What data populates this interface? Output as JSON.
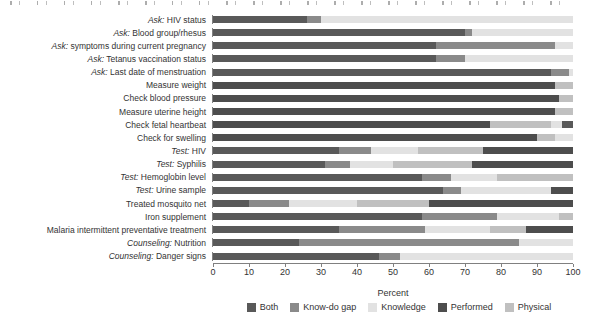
{
  "figure": {
    "xlabel": "Percent",
    "x_ticks": [
      "0",
      "10",
      "20",
      "30",
      "40",
      "50",
      "60",
      "70",
      "80",
      "90",
      "100"
    ]
  },
  "legend": {
    "position": "bottom",
    "items": [
      {
        "label": "Both",
        "color": "#595959"
      },
      {
        "label": "Know-do gap",
        "color": "#8a8a8a"
      },
      {
        "label": "Knowledge",
        "color": "#e2e2e2"
      },
      {
        "label": "Performed",
        "color": "#4d4d4d"
      },
      {
        "label": "Physical",
        "color": "#c0c0c0"
      }
    ]
  },
  "chart_data": {
    "type": "bar",
    "orientation": "horizontal",
    "stacked": true,
    "xlabel": "Percent",
    "xlim": [
      0,
      100
    ],
    "x_tick_values": [
      0,
      10,
      20,
      30,
      40,
      50,
      60,
      70,
      80,
      90,
      100
    ],
    "grid": false,
    "legend_position": "bottom",
    "palette": {
      "Both": "#595959",
      "Know-do gap": "#8a8a8a",
      "Knowledge": "#e2e2e2",
      "Performed": "#4d4d4d",
      "Physical": "#c0c0c0"
    },
    "categories": [
      "Ask: HIV status",
      "Ask: Blood group/rhesus",
      "Ask: symptoms during current pregnancy",
      "Ask: Tetanus vaccination status",
      "Ask: Last date of menstruation",
      "Measure weight",
      "Check blood pressure",
      "Measure uterine height",
      "Check fetal heartbeat",
      "Check for swelling",
      "Test: HIV",
      "Test: Syphilis",
      "Test: Hemoglobin level",
      "Test: Urine sample",
      "Treated mosquito net",
      "Iron supplement",
      "Malaria intermittent preventative treatment",
      "Counseling: Nutrition",
      "Counseling: Danger signs"
    ],
    "rows": [
      {
        "prefix": "Ask:",
        "label": " HIV status",
        "segments": [
          {
            "name": "Both",
            "value": 26
          },
          {
            "name": "Know-do gap",
            "value": 4
          },
          {
            "name": "Knowledge",
            "value": 70
          }
        ]
      },
      {
        "prefix": "Ask:",
        "label": " Blood group/rhesus",
        "segments": [
          {
            "name": "Both",
            "value": 70
          },
          {
            "name": "Know-do gap",
            "value": 2
          },
          {
            "name": "Knowledge",
            "value": 28
          }
        ]
      },
      {
        "prefix": "Ask:",
        "label": " symptoms during current pregnancy",
        "segments": [
          {
            "name": "Both",
            "value": 62
          },
          {
            "name": "Know-do gap",
            "value": 33
          },
          {
            "name": "Knowledge",
            "value": 5
          }
        ]
      },
      {
        "prefix": "Ask:",
        "label": " Tetanus vaccination status",
        "segments": [
          {
            "name": "Both",
            "value": 62
          },
          {
            "name": "Know-do gap",
            "value": 8
          },
          {
            "name": "Knowledge",
            "value": 30
          }
        ]
      },
      {
        "prefix": "Ask:",
        "label": " Last date of menstruation",
        "segments": [
          {
            "name": "Both",
            "value": 94
          },
          {
            "name": "Know-do gap",
            "value": 5
          },
          {
            "name": "Knowledge",
            "value": 1
          }
        ]
      },
      {
        "prefix": "",
        "label": "Measure weight",
        "segments": [
          {
            "name": "Performed",
            "value": 95
          },
          {
            "name": "Physical",
            "value": 5
          }
        ]
      },
      {
        "prefix": "",
        "label": "Check blood pressure",
        "segments": [
          {
            "name": "Performed",
            "value": 96
          },
          {
            "name": "Physical",
            "value": 4
          }
        ]
      },
      {
        "prefix": "",
        "label": "Measure uterine height",
        "segments": [
          {
            "name": "Performed",
            "value": 95
          },
          {
            "name": "Physical",
            "value": 5
          }
        ]
      },
      {
        "prefix": "",
        "label": "Check fetal heartbeat",
        "segments": [
          {
            "name": "Performed",
            "value": 77
          },
          {
            "name": "Physical",
            "value": 17
          },
          {
            "name": "Knowledge",
            "value": 3
          },
          {
            "name": "Both",
            "value": 3
          }
        ]
      },
      {
        "prefix": "",
        "label": "Check for swelling",
        "segments": [
          {
            "name": "Performed",
            "value": 90
          },
          {
            "name": "Physical",
            "value": 5
          },
          {
            "name": "Knowledge",
            "value": 5
          }
        ]
      },
      {
        "prefix": "Test:",
        "label": " HIV",
        "segments": [
          {
            "name": "Both",
            "value": 35
          },
          {
            "name": "Know-do gap",
            "value": 9
          },
          {
            "name": "Knowledge",
            "value": 13
          },
          {
            "name": "Physical",
            "value": 18
          },
          {
            "name": "Performed",
            "value": 25
          }
        ]
      },
      {
        "prefix": "Test:",
        "label": " Syphilis",
        "segments": [
          {
            "name": "Both",
            "value": 31
          },
          {
            "name": "Know-do gap",
            "value": 7
          },
          {
            "name": "Knowledge",
            "value": 12
          },
          {
            "name": "Physical",
            "value": 22
          },
          {
            "name": "Performed",
            "value": 28
          }
        ]
      },
      {
        "prefix": "Test:",
        "label": " Hemoglobin level",
        "segments": [
          {
            "name": "Both",
            "value": 58
          },
          {
            "name": "Know-do gap",
            "value": 8
          },
          {
            "name": "Knowledge",
            "value": 13
          },
          {
            "name": "Physical",
            "value": 21
          }
        ]
      },
      {
        "prefix": "Test:",
        "label": " Urine sample",
        "segments": [
          {
            "name": "Both",
            "value": 64
          },
          {
            "name": "Know-do gap",
            "value": 5
          },
          {
            "name": "Knowledge",
            "value": 25
          },
          {
            "name": "Performed",
            "value": 6
          }
        ]
      },
      {
        "prefix": "",
        "label": "Treated mosquito net",
        "segments": [
          {
            "name": "Both",
            "value": 10
          },
          {
            "name": "Know-do gap",
            "value": 11
          },
          {
            "name": "Knowledge",
            "value": 19
          },
          {
            "name": "Physical",
            "value": 20
          },
          {
            "name": "Performed",
            "value": 40
          }
        ]
      },
      {
        "prefix": "",
        "label": "Iron supplement",
        "segments": [
          {
            "name": "Both",
            "value": 58
          },
          {
            "name": "Know-do gap",
            "value": 21
          },
          {
            "name": "Knowledge",
            "value": 17
          },
          {
            "name": "Physical",
            "value": 4
          }
        ]
      },
      {
        "prefix": "",
        "label": "Malaria intermittent preventative treatment",
        "segments": [
          {
            "name": "Both",
            "value": 35
          },
          {
            "name": "Know-do gap",
            "value": 24
          },
          {
            "name": "Knowledge",
            "value": 18
          },
          {
            "name": "Physical",
            "value": 10
          },
          {
            "name": "Performed",
            "value": 13
          }
        ]
      },
      {
        "prefix": "Counseling:",
        "label": " Nutrition",
        "segments": [
          {
            "name": "Both",
            "value": 24
          },
          {
            "name": "Know-do gap",
            "value": 61
          },
          {
            "name": "Knowledge",
            "value": 15
          }
        ]
      },
      {
        "prefix": "Counseling:",
        "label": " Danger signs",
        "segments": [
          {
            "name": "Both",
            "value": 46
          },
          {
            "name": "Know-do gap",
            "value": 6
          },
          {
            "name": "Knowledge",
            "value": 48
          }
        ]
      }
    ]
  }
}
